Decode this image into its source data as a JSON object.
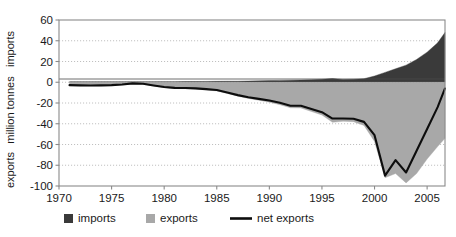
{
  "chart_data": {
    "type": "area",
    "title": "",
    "xlabel": "",
    "ylabel": "million tonnes",
    "ylim": [
      -100,
      60
    ],
    "xlim": [
      1970,
      2006.7
    ],
    "ytick_values": [
      60,
      40,
      20,
      0,
      -20,
      -40,
      -60,
      -80,
      -100
    ],
    "ytick_labels": [
      "60",
      "40",
      "20",
      "0",
      "-20",
      "-40",
      "-60",
      "-80",
      "-100"
    ],
    "xtick_values": [
      1970,
      1975,
      1980,
      1985,
      1990,
      1995,
      2000,
      2005
    ],
    "xtick_labels": [
      "1970",
      "1975",
      "1980",
      "1985",
      "1990",
      "1995",
      "2000",
      "2005"
    ],
    "grid": "horizontal-dotted",
    "legend_position": "bottom",
    "region_label_upper": "imports",
    "region_label_lower": "exports",
    "x": [
      1971,
      1972,
      1973,
      1974,
      1975,
      1976,
      1977,
      1978,
      1979,
      1980,
      1981,
      1982,
      1983,
      1984,
      1985,
      1986,
      1987,
      1988,
      1989,
      1990,
      1991,
      1992,
      1993,
      1994,
      1995,
      1996,
      1997,
      1998,
      1999,
      2000,
      2001,
      2002,
      2003,
      2004,
      2005,
      2006,
      2006.7
    ],
    "series": [
      {
        "name": "imports",
        "color": "#3a3a3a",
        "stack": "up",
        "values": [
          0.4,
          0.4,
          0.4,
          0.4,
          0.4,
          0.4,
          0.5,
          0.5,
          0.5,
          0.6,
          0.6,
          0.7,
          0.7,
          0.8,
          0.9,
          1.0,
          1.0,
          1.2,
          1.4,
          1.6,
          1.8,
          2.0,
          2.2,
          2.5,
          2.8,
          3.6,
          2.6,
          2.8,
          3.4,
          6.0,
          9.5,
          13.0,
          16.5,
          22.0,
          29.0,
          38.0,
          48.0
        ]
      },
      {
        "name": "exports",
        "color": "#a8a8a8",
        "stack": "down",
        "values": [
          -3.2,
          -3.4,
          -3.5,
          -3.4,
          -3.2,
          -2.6,
          -1.6,
          -2.0,
          -3.6,
          -5.2,
          -6.0,
          -6.2,
          -6.6,
          -7.4,
          -8.4,
          -10.8,
          -13.4,
          -15.6,
          -17.4,
          -19.2,
          -21.6,
          -24.6,
          -24.8,
          -28.2,
          -31.6,
          -38.6,
          -37.6,
          -38.0,
          -41.6,
          -57.0,
          -92.0,
          -88.0,
          -97.0,
          -88.0,
          -74.0,
          -62.0,
          -54.0
        ]
      }
    ],
    "net_exports": {
      "name": "net exports",
      "color": "#0d0d0d",
      "values": [
        -2.8,
        -3.0,
        -3.1,
        -3.0,
        -2.8,
        -2.2,
        -1.1,
        -1.5,
        -3.1,
        -4.6,
        -5.4,
        -5.5,
        -5.9,
        -6.6,
        -7.5,
        -9.8,
        -12.4,
        -14.4,
        -16.0,
        -17.6,
        -19.8,
        -22.6,
        -22.6,
        -25.7,
        -28.8,
        -35.0,
        -35.0,
        -35.2,
        -38.2,
        -51.0,
        -90.0,
        -75.0,
        -87.0,
        -66.0,
        -45.0,
        -24.0,
        -6.0
      ]
    },
    "legend": [
      {
        "label": "imports",
        "color": "#3a3a3a",
        "marker": "square"
      },
      {
        "label": "exports",
        "color": "#a8a8a8",
        "marker": "square"
      },
      {
        "label": "net exports",
        "color": "#0d0d0d",
        "marker": "line"
      }
    ]
  }
}
